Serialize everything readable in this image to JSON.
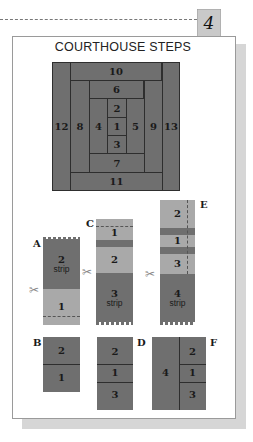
{
  "header": {
    "step_number": "4",
    "title": "COURTHOUSE STEPS"
  },
  "block": {
    "pieces": [
      {
        "label": "10",
        "x": 18,
        "y": 0,
        "w": 92,
        "h": 18
      },
      {
        "label": "6",
        "x": 37,
        "y": 18,
        "w": 55,
        "h": 18
      },
      {
        "label": "2",
        "x": 55,
        "y": 36,
        "w": 19,
        "h": 19
      },
      {
        "label": "12",
        "x": 0,
        "y": 0,
        "w": 18,
        "h": 129
      },
      {
        "label": "8",
        "x": 18,
        "y": 18,
        "w": 19,
        "h": 92
      },
      {
        "label": "4",
        "x": 37,
        "y": 36,
        "w": 18,
        "h": 55
      },
      {
        "label": "1",
        "x": 55,
        "y": 55,
        "w": 19,
        "h": 18
      },
      {
        "label": "5",
        "x": 74,
        "y": 36,
        "w": 18,
        "h": 55
      },
      {
        "label": "9",
        "x": 92,
        "y": 18,
        "w": 18,
        "h": 92
      },
      {
        "label": "13",
        "x": 110,
        "y": 0,
        "w": 18,
        "h": 129
      },
      {
        "label": "3",
        "x": 55,
        "y": 73,
        "w": 19,
        "h": 18
      },
      {
        "label": "7",
        "x": 37,
        "y": 91,
        "w": 55,
        "h": 19
      },
      {
        "label": "11",
        "x": 18,
        "y": 110,
        "w": 92,
        "h": 19
      }
    ]
  },
  "steps": {
    "A": {
      "label": "A",
      "piece2": "2",
      "piece2_sub": "strip",
      "piece1": "1"
    },
    "B": {
      "label": "B",
      "piece2": "2",
      "piece1": "1"
    },
    "C": {
      "label": "C",
      "piece1": "1",
      "piece2": "2",
      "piece3": "3",
      "piece3_sub": "strip"
    },
    "D": {
      "label": "D",
      "piece2": "2",
      "piece1": "1",
      "piece3": "3"
    },
    "E": {
      "label": "E",
      "piece2": "2",
      "piece1": "1",
      "piece3": "3",
      "piece4": "4",
      "piece4_sub": "strip"
    },
    "F": {
      "label": "F",
      "piece4": "4",
      "piece2": "2",
      "piece1": "1",
      "piece3": "3"
    }
  },
  "icons": {
    "scissors": "✂"
  },
  "colors": {
    "dark_fabric": "#6f6f6f",
    "light_fabric": "#a9a9a9",
    "shadow": "#d6d6d6"
  }
}
